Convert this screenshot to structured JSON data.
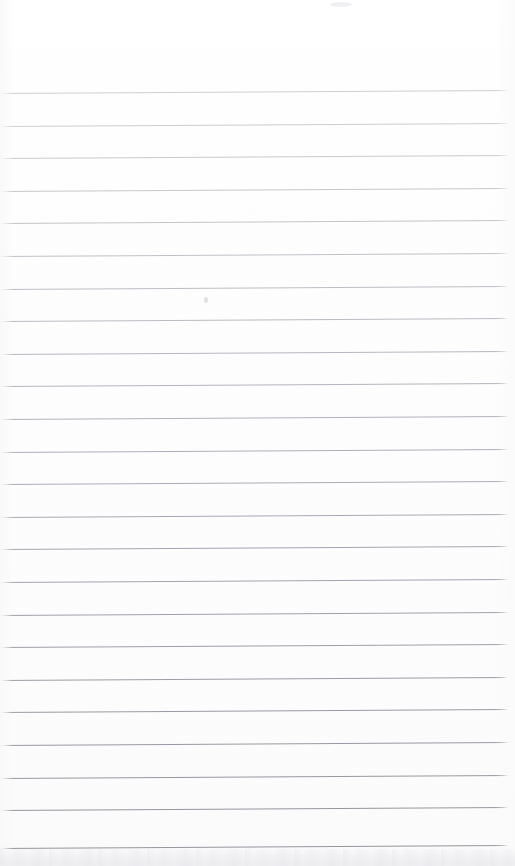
{
  "page": {
    "kind": "scanned-lined-notepad-page",
    "description": "Blank ruled notepad page, scanned. No handwriting or printed text is present.",
    "width_px": 515,
    "height_px": 866,
    "background_color": "#fdfdfe",
    "paper_tone_top": "#ffffff",
    "paper_tone_bottom": "#fbfbfc",
    "top_margin_px": 93,
    "has_text": false,
    "has_header": false,
    "has_page_number": false,
    "has_margin_rule": false
  },
  "ruling": {
    "orientation": "horizontal",
    "line_count": 24,
    "first_line_y_px": 93,
    "line_spacing_px": 32.6,
    "line_thickness_px": 1,
    "skew_degrees": -0.33,
    "left_inset_px": 0,
    "right_inset_px": 7,
    "color_lightest": "#d2d2d6",
    "color_darkest": "#97979c",
    "fade_note": "Lines grow progressively darker from the top of the page toward the bottom.",
    "lines": [
      {
        "index": 1,
        "y_px": 93,
        "color": "#cfcfd4"
      },
      {
        "index": 2,
        "y_px": 126,
        "color": "#cdcdd2"
      },
      {
        "index": 3,
        "y_px": 158,
        "color": "#cacad0"
      },
      {
        "index": 4,
        "y_px": 191,
        "color": "#c7c7cd"
      },
      {
        "index": 5,
        "y_px": 223,
        "color": "#c4c4ca"
      },
      {
        "index": 6,
        "y_px": 256,
        "color": "#c1c1c8"
      },
      {
        "index": 7,
        "y_px": 289,
        "color": "#bebec5"
      },
      {
        "index": 8,
        "y_px": 321,
        "color": "#bbbbc2"
      },
      {
        "index": 9,
        "y_px": 354,
        "color": "#b8b8c0"
      },
      {
        "index": 10,
        "y_px": 386,
        "color": "#b5b5bd"
      },
      {
        "index": 11,
        "y_px": 419,
        "color": "#b2b2ba"
      },
      {
        "index": 12,
        "y_px": 452,
        "color": "#afafb7"
      },
      {
        "index": 13,
        "y_px": 484,
        "color": "#acacb4"
      },
      {
        "index": 14,
        "y_px": 517,
        "color": "#a9a9b1"
      },
      {
        "index": 15,
        "y_px": 549,
        "color": "#a6a6ae"
      },
      {
        "index": 16,
        "y_px": 582,
        "color": "#a4a4ac"
      },
      {
        "index": 17,
        "y_px": 615,
        "color": "#a1a1a9"
      },
      {
        "index": 18,
        "y_px": 647,
        "color": "#9f9fa7"
      },
      {
        "index": 19,
        "y_px": 680,
        "color": "#9d9da5"
      },
      {
        "index": 20,
        "y_px": 712,
        "color": "#9b9ba3"
      },
      {
        "index": 21,
        "y_px": 745,
        "color": "#9a9aa2"
      },
      {
        "index": 22,
        "y_px": 778,
        "color": "#98989f"
      },
      {
        "index": 23,
        "y_px": 810,
        "color": "#97979e"
      },
      {
        "index": 24,
        "y_px": 848,
        "color": "#96969d"
      }
    ]
  },
  "artifacts": {
    "bottom_edge_band": {
      "present": true,
      "y_px": 849,
      "height_px": 17,
      "color": "#f0f0f3",
      "note": "Faint mottled grey band along the bottom trimmed edge of the sheet."
    },
    "specks": [
      {
        "name": "faint-speck-upper-middle",
        "x_px": 204,
        "y_px": 300,
        "color": "#e2e2e6"
      },
      {
        "name": "faint-smudge-top-center",
        "x_px": 330,
        "y_px": 2,
        "color": "#f0f0f3"
      }
    ]
  }
}
